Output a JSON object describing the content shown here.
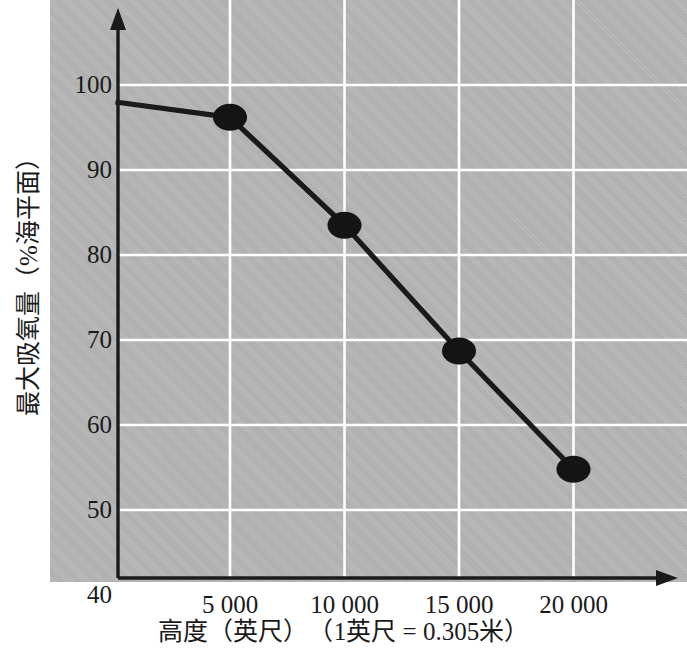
{
  "chart_data": {
    "type": "line",
    "title": "",
    "xlabel": "高度（英尺）　（1英尺 = 0.305米）",
    "ylabel": "最大吸氧量（%海平面）",
    "xlabel_parts": {
      "main": "高度（英尺）",
      "note": "（1英尺 = 0.305米）"
    },
    "x": [
      0,
      5000,
      10000,
      15000,
      20000
    ],
    "values": [
      98,
      96.2,
      83.5,
      68.7,
      54.8
    ],
    "series": [
      {
        "name": "最大吸氧量",
        "x": [
          0,
          5000,
          10000,
          15000,
          20000
        ],
        "values": [
          98,
          96.2,
          83.5,
          68.7,
          54.8
        ]
      }
    ],
    "markers_x": [
      5000,
      10000,
      15000,
      20000
    ],
    "markers_y": [
      96.2,
      83.5,
      68.7,
      54.8
    ],
    "xticks": [
      5000,
      10000,
      15000,
      20000
    ],
    "xticklabels": [
      "5 000",
      "10 000",
      "15 000",
      "20 000"
    ],
    "yticks": [
      40,
      50,
      60,
      70,
      80,
      90,
      100
    ],
    "yticklabels": [
      "40",
      "50",
      "60",
      "70",
      "80",
      "90",
      "100"
    ],
    "xlim": [
      0,
      23000
    ],
    "ylim": [
      38.6,
      108
    ],
    "grid": true,
    "grid_color": "#ffffff",
    "legend": "none",
    "line_color": "#1a1a1a",
    "marker_color": "#141414",
    "panel_color": "#b4b4b4",
    "axis_color": "#1a1a1a"
  },
  "axes": {
    "y_arrow": "up-arrow",
    "x_arrow": "right-arrow"
  }
}
